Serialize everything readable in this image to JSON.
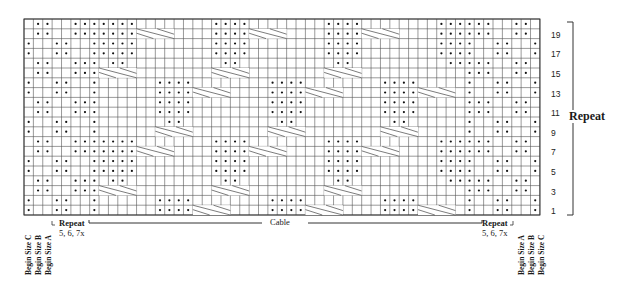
{
  "chart": {
    "columns": 55,
    "rows": 20,
    "origin": {
      "x": 24,
      "y": 19
    },
    "cell": {
      "w": 9.38,
      "h": 9.8
    },
    "grid_color": "#555555",
    "dot_color": "#111111",
    "row_numbers": [
      "1",
      "3",
      "5",
      "7",
      "9",
      "11",
      "13",
      "15",
      "17",
      "19"
    ],
    "edge_left": {
      "phaseA": "-oo--ooo",
      "phaseB": "o--oo--o"
    },
    "edge_right": {
      "phaseA": "ooo--oo-",
      "phaseB": "o--oo--o"
    }
  },
  "labels": {
    "repeat_right": "Repeat",
    "cable": "Cable",
    "left_repeat_line1": "Repeat",
    "left_repeat_line2": "5, 6, 7x",
    "right_repeat_line1": "Repeat",
    "right_repeat_line2": "5, 6, 7x",
    "begin_size_c_left": "Begin Size C",
    "begin_size_b_left": "Begin Size B",
    "begin_size_a_left": "Begin Size A",
    "begin_size_a_right": "Begin Size A",
    "begin_size_b_right": "Begin Size B",
    "begin_size_c_right": "Begin Size C"
  }
}
